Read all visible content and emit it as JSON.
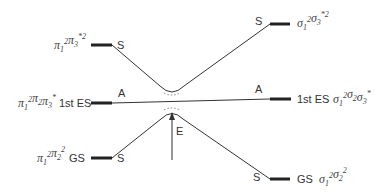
{
  "diagram": {
    "type": "correlation-diagram",
    "left_levels": [
      {
        "id": "left-top",
        "term": {
          "base": [
            [
              "π",
              "1",
              "2"
            ],
            [
              "π",
              "3",
              "*2"
            ]
          ]
        },
        "state_label": "",
        "symmetry": "S"
      },
      {
        "id": "left-middle",
        "term": {
          "base": [
            [
              "π",
              "1",
              "2"
            ],
            [
              "π",
              "2",
              ""
            ],
            [
              "π",
              "3",
              "*"
            ]
          ]
        },
        "state_label": "1st ES",
        "symmetry": "A"
      },
      {
        "id": "left-bottom",
        "term": {
          "base": [
            [
              "π",
              "1",
              "2"
            ],
            [
              "π",
              "2",
              "2"
            ]
          ]
        },
        "state_label": "GS",
        "symmetry": "S"
      }
    ],
    "right_levels": [
      {
        "id": "right-top",
        "term": {
          "base": [
            [
              "σ",
              "1",
              "2"
            ],
            [
              "σ",
              "3",
              "*2"
            ]
          ]
        },
        "state_label": "",
        "symmetry": "S"
      },
      {
        "id": "right-middle",
        "term": {
          "base": [
            [
              "σ",
              "1",
              "2"
            ],
            [
              "σ",
              "2",
              ""
            ],
            [
              "σ",
              "3",
              "*"
            ]
          ]
        },
        "state_label": "1st ES",
        "symmetry": "A"
      },
      {
        "id": "right-bottom",
        "term": {
          "base": [
            [
              "σ",
              "1",
              "2"
            ],
            [
              "σ",
              "2",
              "2"
            ]
          ]
        },
        "state_label": "GS",
        "symmetry": "S"
      }
    ],
    "correlations": [
      {
        "from": "left-top",
        "to": "right-top",
        "symmetry": "S",
        "note": "avoided crossing (upper branch)"
      },
      {
        "from": "left-middle",
        "to": "right-middle",
        "symmetry": "A",
        "note": "straight line"
      },
      {
        "from": "left-bottom",
        "to": "right-bottom",
        "symmetry": "S",
        "note": "avoided crossing (lower branch)"
      }
    ],
    "arrow_label": "E",
    "colors": {
      "line": "#333333",
      "text": "#333333"
    }
  }
}
